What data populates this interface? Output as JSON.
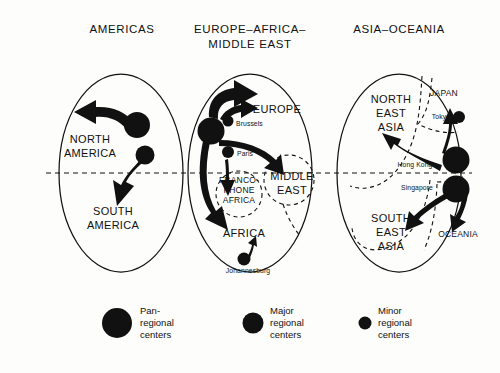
{
  "figure": {
    "type": "regional-flow-diagram",
    "background_color": "#fdfdfb",
    "ink_color": "#111111"
  },
  "panels": [
    {
      "id": "americas",
      "title": "AMERICAS",
      "regions": [
        {
          "name": "NORTH\nAMERICA",
          "line1": "NORTH",
          "line2": "AMERICA"
        },
        {
          "name": "SOUTH\nAMERICA",
          "line1": "SOUTH",
          "line2": "AMERICA"
        }
      ],
      "nodes": [
        {
          "label": "",
          "tier": "pan-regional"
        },
        {
          "label": "",
          "tier": "major-regional"
        }
      ]
    },
    {
      "id": "europe-africa-middle-east",
      "title_line1": "EUROPE–AFRICA–",
      "title_line2": "MIDDLE EAST",
      "regions": [
        {
          "name": "EUROPE"
        },
        {
          "name": "AFRICA"
        },
        {
          "name": "MIDDLE\nEAST",
          "line1": "MIDDLE",
          "line2": "EAST"
        },
        {
          "name": "FRANCO-\nPHONE\nAFRICA",
          "line1": "FRANCO-",
          "line2": "PHONE",
          "line3": "AFRICA"
        }
      ],
      "cities": [
        {
          "name": "Brussels",
          "tier": "minor-regional"
        },
        {
          "name": "Paris",
          "tier": "minor-regional"
        },
        {
          "name": "Johannesburg",
          "tier": "major-regional"
        }
      ]
    },
    {
      "id": "asia-oceania",
      "title": "ASIA–OCEANIA",
      "regions": [
        {
          "name": "NORTH\nEAST\nASIA",
          "line1": "NORTH",
          "line2": "EAST",
          "line3": "ASIA"
        },
        {
          "name": "SOUTH\nEAST\nASIA",
          "line1": "SOUTH",
          "line2": "EAST",
          "line3": "ASIA"
        },
        {
          "name": "JAPAN"
        },
        {
          "name": "OCEANIA"
        }
      ],
      "cities": [
        {
          "name": "Tokyo",
          "tier": "minor-regional"
        },
        {
          "name": "Hong Kong",
          "tier": "pan-regional"
        },
        {
          "name": "Singapore",
          "tier": "pan-regional"
        }
      ]
    }
  ],
  "legend": {
    "items": [
      {
        "tier": "pan-regional",
        "line1": "Pan-",
        "line2": "regional",
        "line3": "centers",
        "radius": 13
      },
      {
        "tier": "major-regional",
        "line1": "Major",
        "line2": "regional",
        "line3": "centers",
        "radius": 9
      },
      {
        "tier": "minor-regional",
        "line1": "Minor",
        "line2": "regional",
        "line3": "centers",
        "radius": 5
      }
    ]
  },
  "footer": {
    "caption": ""
  }
}
